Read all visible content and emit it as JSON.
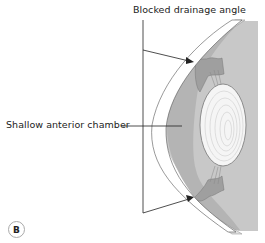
{
  "figure": {
    "panel_letter": "B",
    "labels": {
      "drainage": "Blocked drainage angle",
      "chamber": "Shallow anterior chamber"
    },
    "colors": {
      "background_gray": "#c8c8c8",
      "iris_gray": "#a9a9a9",
      "chamber_gray": "#b9b9b9",
      "cornea_white": "#ffffff",
      "sclera_light": "#dedede",
      "lens_fill": "#f4f4f4",
      "lens_rings": "#c2c2c2",
      "line": "#222222"
    }
  }
}
